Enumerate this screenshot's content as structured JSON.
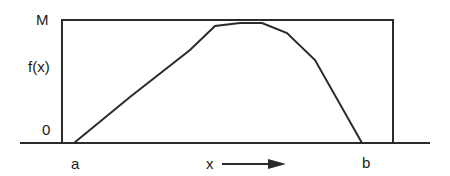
{
  "diagram": {
    "type": "function-bounding-box",
    "labels": {
      "y_max": "M",
      "y_func": "f(x)",
      "y_zero": "0",
      "x_left": "a",
      "x_right": "b",
      "x_axis": "x"
    },
    "box": {
      "left": 62,
      "top": 20,
      "right": 393,
      "bottom": 143
    },
    "baseline": {
      "x1": 20,
      "x2": 430,
      "y": 143
    },
    "curve_points": "74,143 130,97 190,50 215,26 240,23 262,23 287,33 315,60 362,143",
    "arrow": {
      "x1": 220,
      "x2": 285,
      "y": 164
    },
    "stroke_color": "#2a2a2a"
  }
}
